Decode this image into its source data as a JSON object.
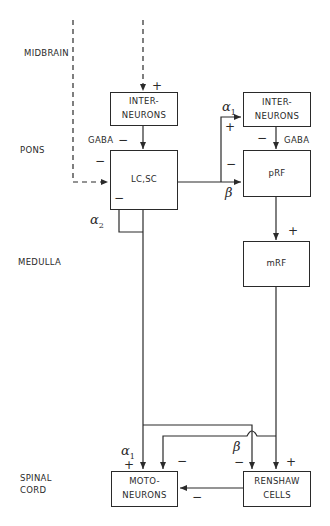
{
  "regions": {
    "midbrain": "MIDBRAIN",
    "pons": "PONS",
    "medulla": "MEDULLA",
    "spinal_cord_line1": "SPINAL",
    "spinal_cord_line2": "CORD"
  },
  "nodes": {
    "interneurons_left": {
      "line1": "INTER-",
      "line2": "NEURONS"
    },
    "lc_sc": {
      "label": "LC,SC"
    },
    "interneurons_right": {
      "line1": "INTER-",
      "line2": "NEURONS"
    },
    "prf": {
      "label": "pRF"
    },
    "mrf": {
      "label": "mRF"
    },
    "motoneurons": {
      "line1": "MOTO-",
      "line2": "NEURONS"
    },
    "renshaw": {
      "line1": "RENSHAW",
      "line2": "CELLS"
    }
  },
  "annotations": {
    "plus_into_left_interneurons": "+",
    "gaba_left": "GABA",
    "minus_gaba_left": "−",
    "minus_dashed_into_lcsc": "−",
    "alpha2": "α",
    "alpha2_sub": "2",
    "minus_alpha2": "−",
    "alpha1_top": "α",
    "alpha1_top_sub": "1",
    "plus_alpha1_top": "+",
    "minus_beta_prf": "−",
    "beta_prf": "β",
    "minus_gaba_right": "−",
    "gaba_right": "GABA",
    "plus_mrf": "+",
    "alpha1_bottom": "α",
    "alpha1_bottom_sub": "1",
    "plus_alpha1_bottom": "+",
    "minus_moto_from_prf": "−",
    "beta_bottom": "β",
    "minus_beta_renshaw": "−",
    "plus_renshaw": "+",
    "minus_renshaw_to_moto": "−"
  },
  "colors": {
    "line": "#2a2a2a",
    "background": "#ffffff"
  }
}
